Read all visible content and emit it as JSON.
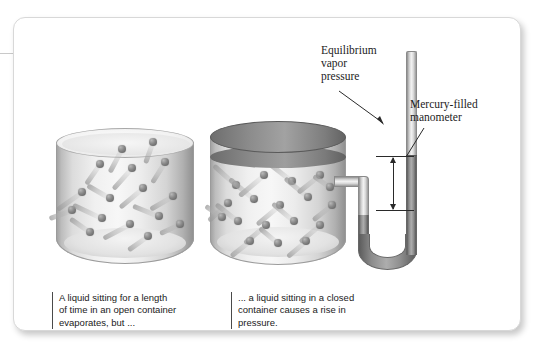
{
  "labels": {
    "equilibrium_vapor_pressure": "Equilibrium\nvapor\npressure",
    "mercury_filled_manometer": "Mercury-filled\nmanometer"
  },
  "captions": {
    "open_container": "A liquid sitting for a length\nof time in an open container\nevaporates, but ...",
    "closed_container": "... a liquid sitting in a closed\ncontainer causes a rise in\npressure."
  },
  "icons": {
    "beaker_open": "open-container-icon",
    "beaker_closed": "closed-container-icon",
    "manometer": "u-tube-manometer-icon",
    "measurement_arrow": "double-headed-arrow-icon"
  },
  "colors": {
    "card_background": "#ffffff",
    "card_border": "#d8d8d8",
    "mercury": "#8c8c8c",
    "tube_glass": "#f2f2f2",
    "lid": "#7d7d7d",
    "molecule": "#888888",
    "text": "#1a1a1a",
    "annotation_line": "#2a2a2a"
  },
  "molecules_open": [
    {
      "x": 62,
      "y": 17,
      "angle": -62,
      "len": 26
    },
    {
      "x": 93,
      "y": 10,
      "angle": -70,
      "len": 22
    },
    {
      "x": 40,
      "y": 32,
      "angle": -55,
      "len": 24
    },
    {
      "x": 72,
      "y": 36,
      "angle": -48,
      "len": 28
    },
    {
      "x": 105,
      "y": 30,
      "angle": -58,
      "len": 24
    },
    {
      "x": 22,
      "y": 60,
      "angle": -35,
      "len": 30
    },
    {
      "x": 50,
      "y": 66,
      "angle": 30,
      "len": 26
    },
    {
      "x": 83,
      "y": 56,
      "angle": -40,
      "len": 30
    },
    {
      "x": 113,
      "y": 64,
      "angle": -30,
      "len": 26
    },
    {
      "x": 12,
      "y": 78,
      "angle": -20,
      "len": 24
    },
    {
      "x": 42,
      "y": 86,
      "angle": 25,
      "len": 32
    },
    {
      "x": 70,
      "y": 92,
      "angle": -28,
      "len": 30
    },
    {
      "x": 99,
      "y": 84,
      "angle": 22,
      "len": 28
    },
    {
      "x": 120,
      "y": 92,
      "angle": -25,
      "len": 22
    },
    {
      "x": 30,
      "y": 100,
      "angle": 35,
      "len": 24
    },
    {
      "x": 88,
      "y": 104,
      "angle": -35,
      "len": 24
    }
  ],
  "molecules_closed": [
    {
      "x": 22,
      "y": 60,
      "angle": 42,
      "len": 30
    },
    {
      "x": 50,
      "y": 50,
      "angle": -40,
      "len": 32
    },
    {
      "x": 78,
      "y": 56,
      "angle": 38,
      "len": 30
    },
    {
      "x": 106,
      "y": 50,
      "angle": -38,
      "len": 28
    },
    {
      "x": 14,
      "y": 78,
      "angle": -42,
      "len": 26
    },
    {
      "x": 40,
      "y": 74,
      "angle": 40,
      "len": 32
    },
    {
      "x": 66,
      "y": 80,
      "angle": -40,
      "len": 30
    },
    {
      "x": 94,
      "y": 72,
      "angle": 40,
      "len": 30
    },
    {
      "x": 118,
      "y": 80,
      "angle": -38,
      "len": 24
    },
    {
      "x": 24,
      "y": 96,
      "angle": 38,
      "len": 28
    },
    {
      "x": 52,
      "y": 100,
      "angle": -40,
      "len": 28
    },
    {
      "x": 80,
      "y": 96,
      "angle": 40,
      "len": 28
    },
    {
      "x": 106,
      "y": 100,
      "angle": -40,
      "len": 26
    },
    {
      "x": 36,
      "y": 116,
      "angle": -38,
      "len": 24
    },
    {
      "x": 64,
      "y": 118,
      "angle": 40,
      "len": 24
    },
    {
      "x": 92,
      "y": 116,
      "angle": -40,
      "len": 24
    },
    {
      "x": 116,
      "y": 62,
      "angle": 35,
      "len": 20
    },
    {
      "x": 8,
      "y": 92,
      "angle": 35,
      "len": 20
    }
  ]
}
